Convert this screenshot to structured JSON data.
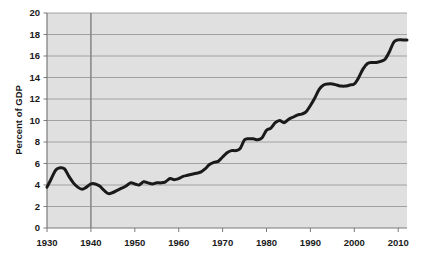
{
  "chart_data": {
    "type": "line",
    "title": "",
    "xlabel": "",
    "ylabel": "Percent of GDP",
    "xlim": [
      1930,
      2012
    ],
    "ylim": [
      0,
      20
    ],
    "grid": "horizontal",
    "legend": "none",
    "xticks": [
      1930,
      1940,
      1950,
      1960,
      1970,
      1980,
      1990,
      2000,
      2010
    ],
    "xtick_labels": [
      "1930",
      "1940",
      "1950",
      "1960",
      "1970",
      "1980",
      "1990",
      "2000",
      "2010"
    ],
    "yticks": [
      0,
      2,
      4,
      6,
      8,
      10,
      12,
      14,
      16,
      18,
      20
    ],
    "ytick_labels": [
      "0",
      "2",
      "4",
      "6",
      "8",
      "10",
      "12",
      "14",
      "16",
      "18",
      "20"
    ],
    "annotations": [
      {
        "type": "vertical-reference-line",
        "x": 1940,
        "label": ""
      }
    ],
    "series": [
      {
        "name": "Percent of GDP",
        "color": "#1a1a1a",
        "line_width": 3,
        "x": [
          1930,
          1931,
          1932,
          1933,
          1934,
          1935,
          1936,
          1937,
          1938,
          1939,
          1940,
          1941,
          1942,
          1943,
          1944,
          1945,
          1946,
          1947,
          1948,
          1949,
          1950,
          1951,
          1952,
          1953,
          1954,
          1955,
          1956,
          1957,
          1958,
          1959,
          1960,
          1961,
          1962,
          1963,
          1964,
          1965,
          1966,
          1967,
          1968,
          1969,
          1970,
          1971,
          1972,
          1973,
          1974,
          1975,
          1976,
          1977,
          1978,
          1979,
          1980,
          1981,
          1982,
          1983,
          1984,
          1985,
          1986,
          1987,
          1988,
          1989,
          1990,
          1991,
          1992,
          1993,
          1994,
          1995,
          1996,
          1997,
          1998,
          1999,
          2000,
          2001,
          2002,
          2003,
          2004,
          2005,
          2006,
          2007,
          2008,
          2009,
          2010,
          2011,
          2012
        ],
        "y": [
          3.8,
          4.6,
          5.4,
          5.6,
          5.5,
          4.8,
          4.2,
          3.8,
          3.6,
          3.8,
          4.1,
          4.1,
          3.9,
          3.5,
          3.2,
          3.3,
          3.5,
          3.7,
          3.9,
          4.2,
          4.1,
          4.0,
          4.3,
          4.2,
          4.1,
          4.2,
          4.2,
          4.3,
          4.6,
          4.5,
          4.6,
          4.8,
          4.9,
          5.0,
          5.1,
          5.2,
          5.5,
          5.9,
          6.1,
          6.2,
          6.6,
          7.0,
          7.2,
          7.2,
          7.4,
          8.2,
          8.3,
          8.3,
          8.2,
          8.4,
          9.1,
          9.3,
          9.8,
          10.0,
          9.8,
          10.1,
          10.3,
          10.5,
          10.6,
          10.8,
          11.4,
          12.1,
          12.9,
          13.3,
          13.4,
          13.4,
          13.3,
          13.2,
          13.2,
          13.3,
          13.4,
          14.0,
          14.8,
          15.3,
          15.4,
          15.4,
          15.5,
          15.7,
          16.4,
          17.3,
          17.5,
          17.5,
          17.5
        ]
      }
    ]
  },
  "axis": {
    "ylabel_text": "Percent of GDP"
  },
  "colors": {
    "plot_background": "#e0e0e0",
    "gridline": "#9a9a9a",
    "axis_line": "#7a7a7a",
    "series_line": "#1a1a1a",
    "reference_line": "#8a8a8a",
    "text": "#1a1a1a"
  }
}
